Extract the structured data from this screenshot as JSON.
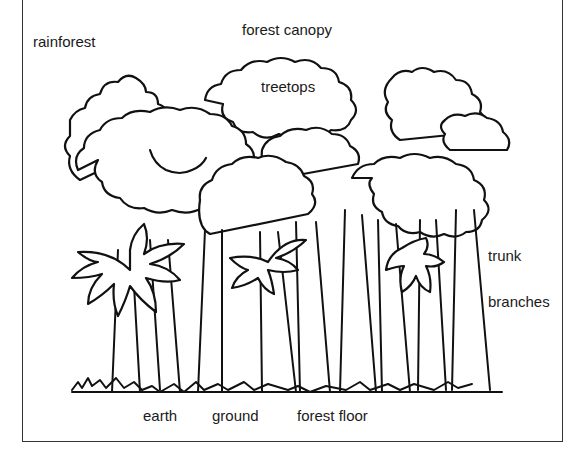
{
  "diagram": {
    "labels": {
      "rainforest": "rainforest",
      "forest_canopy": "forest canopy",
      "treetops": "treetops",
      "trunk": "trunk",
      "branches": "branches",
      "earth": "earth",
      "ground": "ground",
      "forest_floor": "forest floor"
    },
    "colors": {
      "ink": "#111111",
      "background": "#ffffff",
      "frame": "#333333"
    }
  }
}
